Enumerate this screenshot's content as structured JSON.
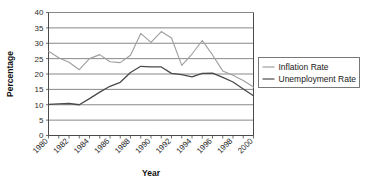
{
  "chart_data": {
    "type": "line",
    "title": "",
    "xlabel": "Year",
    "ylabel": "Percentage",
    "xlim": [
      1980,
      2000
    ],
    "ylim": [
      0,
      40
    ],
    "ytick_step": 5,
    "xtick_step": 1,
    "xlabel_step": 2,
    "grid": true,
    "legend_position": "right",
    "x": [
      1980,
      1981,
      1982,
      1983,
      1984,
      1985,
      1986,
      1987,
      1988,
      1989,
      1990,
      1991,
      1992,
      1993,
      1994,
      1995,
      1996,
      1997,
      1998,
      1999,
      2000
    ],
    "xtick_labels": [
      "1980",
      "1982",
      "1984",
      "1986",
      "1988",
      "1990",
      "1992",
      "1994",
      "1996",
      "1998",
      "2000"
    ],
    "ytick_labels": [
      "0",
      "5",
      "10",
      "15",
      "20",
      "25",
      "30",
      "35",
      "40"
    ],
    "series": [
      {
        "name": "Inflation Rate",
        "color": "#9e9e9e",
        "width": 1.1,
        "values": [
          27.4,
          25.3,
          23.8,
          21.4,
          25.0,
          26.3,
          24.0,
          23.7,
          26.1,
          33.2,
          30.3,
          33.8,
          31.7,
          22.8,
          26.5,
          30.9,
          26.2,
          21.0,
          19.6,
          17.9,
          15.8
        ]
      },
      {
        "name": "Unemployment Rate",
        "color": "#4a4a4a",
        "width": 1.3,
        "values": [
          10.1,
          10.3,
          10.4,
          10.0,
          12.0,
          14.1,
          16.0,
          17.3,
          20.5,
          22.5,
          22.3,
          22.3,
          20.2,
          19.8,
          19.1,
          20.2,
          20.3,
          18.9,
          17.4,
          15.1,
          12.9
        ]
      }
    ]
  },
  "legend": {
    "items": [
      {
        "label": "Inflation Rate",
        "color": "#9e9e9e"
      },
      {
        "label": "Unemployment Rate",
        "color": "#4a4a4a"
      }
    ]
  },
  "axes": {
    "x_title": "Year",
    "y_title": "Percentage"
  }
}
